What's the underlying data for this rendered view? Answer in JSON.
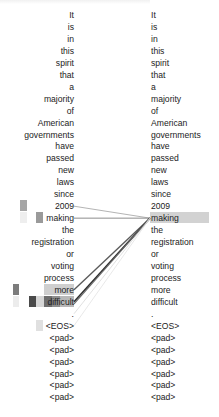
{
  "figure": {
    "type": "attention-visualization",
    "left_tokens": [
      "It",
      "is",
      "in",
      "this",
      "spirit",
      "that",
      "a",
      "majority",
      "of",
      "American",
      "governments",
      "have",
      "passed",
      "new",
      "laws",
      "since",
      "2009",
      "making",
      "the",
      "registration",
      "or",
      "voting",
      "process",
      "more",
      "difficult",
      ".",
      "<EOS>",
      "<pad>",
      "<pad>",
      "<pad>",
      "<pad>",
      "<pad>",
      "<pad>"
    ],
    "right_tokens": [
      "It",
      "is",
      "in",
      "this",
      "spirit",
      "that",
      "a",
      "majority",
      "of",
      "American",
      "governments",
      "have",
      "passed",
      "new",
      "laws",
      "since",
      "2009",
      "making",
      "the",
      "registration",
      "or",
      "voting",
      "process",
      "more",
      "difficult",
      ".",
      "<EOS>",
      "<pad>",
      "<pad>",
      "<pad>",
      "<pad>",
      "<pad>",
      "<pad>"
    ],
    "highlighted_right_token_index": 17,
    "highlight_color": "#d2d2d2",
    "attention_links": [
      {
        "from_index": 16,
        "to_index": 17,
        "color": "#b4b4b4",
        "width": 1.0
      },
      {
        "from_index": 17,
        "to_index": 17,
        "color": "#8c8c8c",
        "width": 1.0
      },
      {
        "from_index": 23,
        "to_index": 17,
        "color": "#5a5a5a",
        "width": 1.4
      },
      {
        "from_index": 24,
        "to_index": 17,
        "color": "#2e2e2e",
        "width": 1.6
      },
      {
        "from_index": 24,
        "to_index": 17,
        "color": "#6a6a6a",
        "width": 1.2
      },
      {
        "from_index": 25,
        "to_index": 17,
        "color": "#d8d8d8",
        "width": 0.8
      },
      {
        "from_index": 26,
        "to_index": 17,
        "color": "#e2e2e2",
        "width": 0.8
      }
    ],
    "heat_cells": [
      {
        "row": 16,
        "x": 20,
        "w": 7,
        "color": "#a6a6a6"
      },
      {
        "row": 17,
        "x": 20,
        "w": 7,
        "color": "#eeeeee"
      },
      {
        "row": 17,
        "x": 36,
        "w": 7,
        "color": "#9a9a9a"
      },
      {
        "row": 23,
        "x": 13,
        "w": 6,
        "color": "#7c7c7c"
      },
      {
        "row": 23,
        "x": 44,
        "w": 30,
        "color": "#cfcfcf"
      },
      {
        "row": 24,
        "x": 13,
        "w": 6,
        "color": "#ececec"
      },
      {
        "row": 24,
        "x": 29,
        "w": 7,
        "color": "#4a4a4a"
      },
      {
        "row": 24,
        "x": 36,
        "w": 8,
        "color": "#d6d6d6"
      },
      {
        "row": 24,
        "x": 44,
        "w": 8,
        "color": "#6e6e6e"
      },
      {
        "row": 24,
        "x": 52,
        "w": 8,
        "color": "#8e8e8e"
      },
      {
        "row": 24,
        "x": 60,
        "w": 14,
        "color": "#b8b8b8"
      },
      {
        "row": 26,
        "x": 36,
        "w": 7,
        "color": "#e0e0e0"
      }
    ],
    "layout": {
      "row_top": 9,
      "row_height": 11.95
    }
  }
}
